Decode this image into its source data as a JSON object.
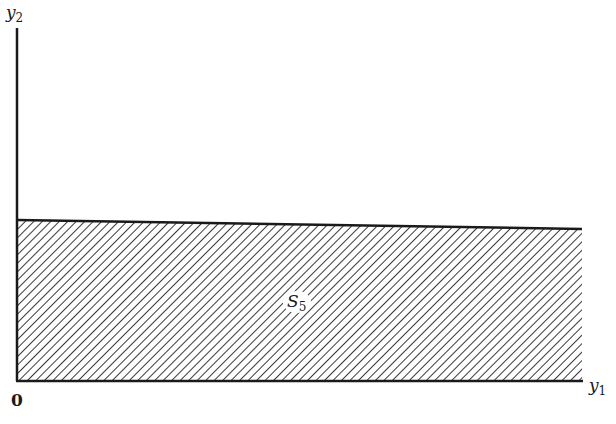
{
  "diagram": {
    "axes": {
      "y_axis_label": "y",
      "y_axis_subscript": "2",
      "x_axis_label": "y",
      "x_axis_subscript": "1",
      "origin_label": "0"
    },
    "region": {
      "label": "S",
      "label_subscript": "5",
      "fill": "hatched",
      "description": "Region bounded below by the y1 axis and above by a nearly horizontal line"
    },
    "colors": {
      "line": "#1a1a1a",
      "hatch": "#3a3a3a",
      "background": "#ffffff"
    }
  }
}
